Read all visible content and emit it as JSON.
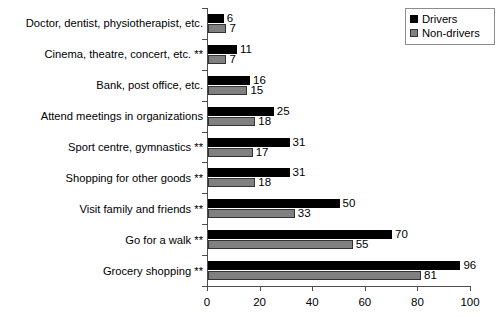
{
  "chart_data": {
    "type": "bar",
    "orientation": "horizontal",
    "title": "",
    "xlabel": "",
    "ylabel": "",
    "xlim": [
      0,
      100
    ],
    "xticks": [
      0,
      20,
      40,
      60,
      80,
      100
    ],
    "grid": false,
    "legend_position": "top-right",
    "categories": [
      "Doctor, dentist, physiotherapist, etc.",
      "Cinema, theatre, concert, etc. **",
      "Bank, post office, etc.",
      "Attend meetings in organizations",
      "Sport centre, gymnastics **",
      "Shopping for other goods **",
      "Visit family and friends **",
      "Go for a walk **",
      "Grocery shopping **"
    ],
    "series": [
      {
        "name": "Drivers",
        "color": "#000000",
        "values": [
          6,
          11,
          16,
          25,
          31,
          31,
          50,
          70,
          96
        ]
      },
      {
        "name": "Non-drivers",
        "color": "#808080",
        "values": [
          7,
          7,
          15,
          18,
          17,
          18,
          33,
          55,
          81
        ]
      }
    ]
  },
  "legend": {
    "items": [
      {
        "label": "Drivers",
        "swatch": "drivers"
      },
      {
        "label": "Non-drivers",
        "swatch": "nondrivers"
      }
    ]
  }
}
